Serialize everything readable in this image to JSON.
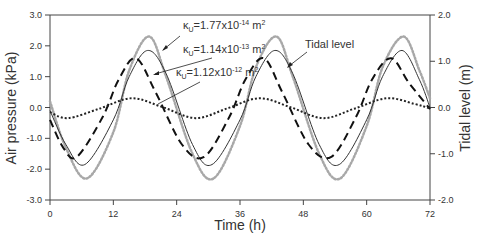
{
  "chart_data": {
    "type": "line",
    "title": "",
    "xlabel": "Time (h)",
    "ylabel": "Air pressure (kPa)",
    "y2label": "Tidal level (m)",
    "xlim": [
      0,
      72
    ],
    "ylim": [
      -3.0,
      3.0
    ],
    "y2lim": [
      -2.0,
      2.0
    ],
    "xticks": [
      "0",
      "12",
      "24",
      "36",
      "48",
      "60",
      "72"
    ],
    "yticks": [
      "3.0",
      "2.0",
      "1.0",
      "0.0",
      "-1.0",
      "-2.0",
      "-3.0"
    ],
    "y2ticks": [
      "2.0",
      "1.0",
      "0.0",
      "-1.0",
      "-2.0"
    ],
    "grid": false,
    "series": [
      {
        "name": "κu=1.77x10^-14 m²",
        "axis": "left",
        "style": "gray-dots",
        "color": "#a8a8a8",
        "x": [
          0,
          3,
          7,
          12,
          15,
          18.8,
          22,
          27,
          31,
          36,
          39,
          42.9,
          46,
          51,
          55,
          60,
          63,
          67,
          70,
          72
        ],
        "values": [
          0.2,
          -1.3,
          -2.3,
          -0.8,
          1.2,
          2.3,
          1.0,
          -1.5,
          -2.3,
          -0.6,
          1.3,
          2.3,
          1.0,
          -1.5,
          -2.3,
          -0.6,
          1.3,
          2.3,
          1.2,
          0.3
        ]
      },
      {
        "name": "κu=1.14x10^-13 m²",
        "axis": "left",
        "style": "solid",
        "color": "#333333",
        "x": [
          0,
          3,
          6.6,
          12,
          15,
          18.5,
          22,
          27,
          30.7,
          36,
          39,
          42.6,
          46,
          51,
          54.8,
          60,
          63,
          66.7,
          70,
          72
        ],
        "values": [
          -0.1,
          -1.2,
          -1.85,
          -0.4,
          1.0,
          1.85,
          1.1,
          -1.2,
          -1.85,
          -0.4,
          1.0,
          1.85,
          1.1,
          -1.2,
          -1.85,
          -0.4,
          1.0,
          1.85,
          0.9,
          0.0
        ]
      },
      {
        "name": "κu=1.12x10^-12 m²",
        "axis": "left",
        "style": "dashed",
        "color": "#111111",
        "x": [
          0,
          2.5,
          5.1,
          10,
          13,
          16.3,
          20,
          25,
          29.2,
          34,
          37,
          40.5,
          44,
          49,
          53.3,
          58,
          61,
          64.6,
          68,
          72
        ],
        "values": [
          -0.4,
          -1.3,
          -1.6,
          -0.3,
          0.9,
          1.6,
          0.5,
          -1.2,
          -1.6,
          -0.3,
          0.9,
          1.6,
          0.5,
          -1.2,
          -1.6,
          -0.3,
          0.9,
          1.6,
          0.8,
          -0.05
        ]
      },
      {
        "name": "Tidal level",
        "axis": "right",
        "style": "dotted",
        "color": "#222222",
        "x": [
          0,
          3.4,
          9.5,
          15.5,
          21.5,
          27.6,
          33.6,
          39.7,
          45.7,
          51.8,
          57.8,
          63.8,
          69,
          72
        ],
        "values": [
          -0.1,
          -0.23,
          -0.02,
          0.2,
          0.0,
          -0.23,
          -0.02,
          0.2,
          0.0,
          -0.23,
          -0.02,
          0.2,
          0.08,
          -0.02
        ]
      }
    ],
    "annotations": [
      {
        "text": "κu=1.77x10^-14 m²",
        "target": "gray-dots"
      },
      {
        "text": "κu=1.14x10^-13 m²",
        "target": "solid"
      },
      {
        "text": "κu=1.12x10^-12 m²",
        "target": "dashed"
      },
      {
        "text": "Tidal level",
        "target": "dotted"
      }
    ]
  },
  "labels": {
    "xlabel": "Time (h)",
    "ylabel": "Air pressure (kPa)",
    "y2label": "Tidal level (m)",
    "ann1_prefix": "κ",
    "ann1_sub": "U",
    "ann1_value": "=1.77x10",
    "ann1_exp": "-14",
    "ann1_unit": " m",
    "ann2_value": "=1.14x10",
    "ann2_exp": "-13",
    "ann3_value": "=1.12x10",
    "ann3_exp": "-12",
    "unit_sup": "2",
    "tidal": "Tidal level"
  }
}
